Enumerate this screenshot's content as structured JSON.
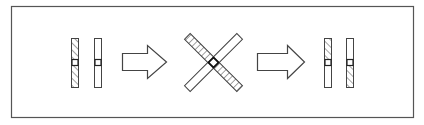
{
  "diagram": {
    "type": "process-sequence",
    "frame": {
      "x": 11,
      "y": 6,
      "width": 403,
      "height": 112,
      "stroke": "#555555"
    },
    "colors": {
      "stroke": "#444444",
      "background": "#ffffff",
      "hatch": "#555555"
    },
    "steps": [
      {
        "id": "step-1-separated",
        "description": "Two parallel vertical bars with center pivot; left bar fully hatched, right bar plain",
        "bars": [
          {
            "x": 71,
            "y": 38,
            "w": 7,
            "h": 49,
            "hatch": "full"
          },
          {
            "x": 94,
            "y": 38,
            "w": 7,
            "h": 49,
            "hatch": "none"
          }
        ]
      },
      {
        "id": "arrow-1",
        "description": "Hollow right-pointing block arrow",
        "shaft": {
          "x1": 122,
          "y1": 53,
          "x2": 147,
          "y2": 70
        },
        "head": {
          "x": 147,
          "tip_x": 167,
          "top": 45,
          "bottom": 78
        }
      },
      {
        "id": "step-2-crossed",
        "description": "Two bars crossed in an X sharing a center pivot; hatched bar runs top-left to bottom-right",
        "center": {
          "x": 213,
          "y": 62
        },
        "bars": [
          {
            "angle": 45,
            "length": 72,
            "w": 8,
            "hatch": "full"
          },
          {
            "angle": -45,
            "length": 72,
            "w": 8,
            "hatch": "none"
          }
        ]
      },
      {
        "id": "arrow-2",
        "description": "Hollow right-pointing block arrow",
        "shaft": {
          "x1": 257,
          "y1": 53,
          "x2": 287,
          "y2": 70
        },
        "head": {
          "x": 287,
          "tip_x": 304,
          "top": 45,
          "bottom": 78
        }
      },
      {
        "id": "step-3-recombined",
        "description": "Two parallel vertical bars with swapped halves; left bar hatched on top, right bar hatched on bottom",
        "bars": [
          {
            "x": 324,
            "y": 38,
            "w": 7,
            "h": 49,
            "hatch": "top"
          },
          {
            "x": 346,
            "y": 38,
            "w": 7,
            "h": 49,
            "hatch": "bottom"
          }
        ]
      }
    ]
  }
}
